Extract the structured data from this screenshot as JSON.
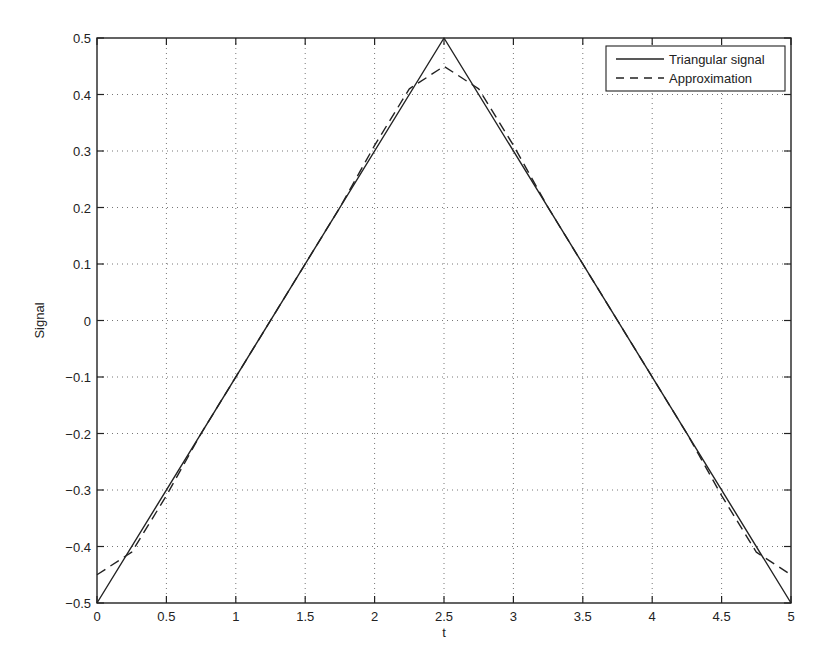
{
  "chart_data": {
    "type": "line",
    "title": "",
    "xlabel": "t",
    "ylabel": "Signal",
    "xlim": [
      0,
      5
    ],
    "ylim": [
      -0.5,
      0.5
    ],
    "grid": true,
    "grid_style": "dotted",
    "legend_position": "upper right",
    "x_ticks": [
      0,
      0.5,
      1,
      1.5,
      2,
      2.5,
      3,
      3.5,
      4,
      4.5,
      5
    ],
    "x_tick_labels": [
      "0",
      "0.5",
      "1",
      "1.5",
      "2",
      "2.5",
      "3",
      "3.5",
      "4",
      "4.5",
      "5"
    ],
    "y_ticks": [
      -0.5,
      -0.4,
      -0.3,
      -0.2,
      -0.1,
      0,
      0.1,
      0.2,
      0.3,
      0.4,
      0.5
    ],
    "y_tick_labels": [
      "−0.5",
      "−0.4",
      "−0.3",
      "−0.2",
      "−0.1",
      "0",
      "0.1",
      "0.2",
      "0.3",
      "0.4",
      "0.5"
    ],
    "series": [
      {
        "name": "Triangular signal",
        "style": "solid",
        "color": "#222222",
        "x": [
          0,
          2.5,
          5
        ],
        "y": [
          -0.5,
          0.5,
          -0.5
        ]
      },
      {
        "name": "Approximation",
        "style": "dashed",
        "color": "#222222",
        "x": [
          0,
          0.25,
          0.5,
          0.75,
          1,
          1.25,
          1.5,
          1.75,
          2,
          2.25,
          2.5,
          2.75,
          3,
          3.25,
          3.5,
          3.75,
          4,
          4.25,
          4.5,
          4.75,
          5
        ],
        "y": [
          -0.45,
          -0.41,
          -0.31,
          -0.2,
          -0.1,
          0,
          0.1,
          0.2,
          0.31,
          0.41,
          0.45,
          0.41,
          0.31,
          0.2,
          0.1,
          0,
          -0.1,
          -0.2,
          -0.31,
          -0.41,
          -0.45
        ]
      }
    ]
  },
  "legend": {
    "items": [
      {
        "label": "Triangular signal",
        "style": "solid"
      },
      {
        "label": "Approximation",
        "style": "dashed"
      }
    ]
  }
}
